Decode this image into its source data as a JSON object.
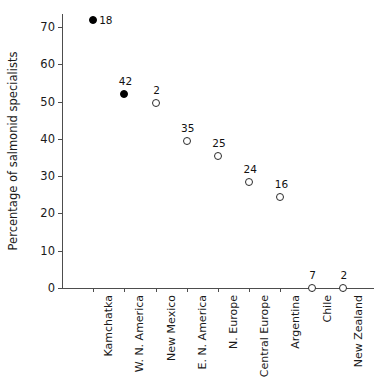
{
  "chart_data": {
    "type": "scatter",
    "title": "",
    "xlabel": "",
    "ylabel": "Percentage of salmonid specialists",
    "ylim": [
      0,
      73.5
    ],
    "yticks": [
      0,
      10,
      20,
      30,
      40,
      50,
      60,
      70
    ],
    "ytick_labels": [
      "0",
      "10",
      "20",
      "30",
      "40",
      "50",
      "60",
      "70"
    ],
    "grid": false,
    "legend": "none",
    "categories": [
      "Kamchatka",
      "W. N. America",
      "New Mexico",
      "E. N. America",
      "N. Europe",
      "Central Europe",
      "Argentina",
      "Chile",
      "New Zealand"
    ],
    "values": [
      72,
      52,
      49.5,
      39.5,
      35.5,
      28.5,
      24.5,
      0,
      0
    ],
    "point_labels": [
      "18",
      "42",
      "2",
      "35",
      "25",
      "24",
      "16",
      "7",
      "2"
    ],
    "marker_styles": [
      "filled",
      "filled",
      "open",
      "open",
      "open",
      "open",
      "open",
      "open",
      "open"
    ],
    "label_placement": [
      "right",
      "above",
      "above",
      "above",
      "above",
      "above",
      "above",
      "above",
      "above"
    ],
    "colors": {
      "filled_marker": "#000000",
      "open_marker_edge": "#2b2b2b",
      "axis": "#4d4d4d",
      "text": "#1a1a1a",
      "background": "#ffffff"
    }
  }
}
